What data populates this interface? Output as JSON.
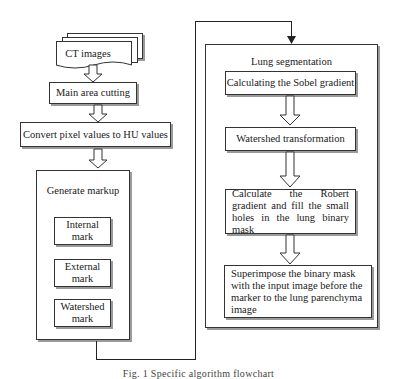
{
  "diagram": {
    "left_flow": {
      "input": "CT images",
      "step1": "Main area cutting",
      "step2": "Convert pixel values to HU values",
      "markup_group": {
        "title": "Generate markup",
        "items": [
          "Internal mark",
          "External mark",
          "Watershed mark"
        ]
      }
    },
    "right_flow": {
      "title": "Lung segmentation",
      "steps": [
        "Calculating the Sobel gradient",
        "Watershed transformation",
        "Calculate the Robert gradient and fill the small holes in the lung binary mask",
        "Superimpose the binary mask with the input image before the marker to the lung parenchyma image"
      ]
    },
    "caption": "Fig. 1  Specific algorithm flowchart"
  }
}
